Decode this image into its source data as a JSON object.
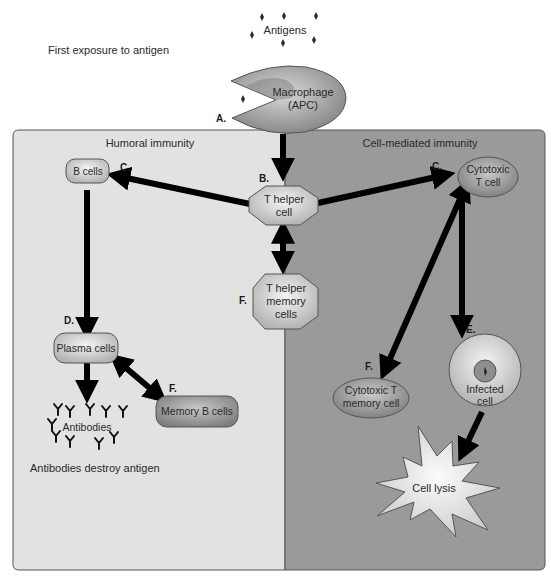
{
  "header": {
    "first_exposure": "First exposure to antigen",
    "antigens": "Antigens"
  },
  "macrophage": {
    "line1": "Macrophage",
    "line2": "(APC)",
    "step": "A."
  },
  "panels": {
    "left": {
      "title": "Humoral immunity",
      "color": "#e2e2e2"
    },
    "right": {
      "title": "Cell-mediated immunity",
      "color": "#9a9a9a"
    }
  },
  "nodes": {
    "t_helper": {
      "line1": "T helper",
      "line2": "cell",
      "step": "B."
    },
    "t_helper_memory": {
      "line1": "T helper",
      "line2": "memory",
      "line3": "cells",
      "step": "F."
    },
    "b_cells": {
      "label": "B cells",
      "step": "C."
    },
    "plasma_cells": {
      "label": "Plasma cells",
      "step": "D."
    },
    "memory_b_cells": {
      "label": "Memory B cells",
      "step": "F."
    },
    "antibodies": {
      "label": "Antibodies",
      "caption": "Antibodies destroy antigen"
    },
    "cytotoxic_t": {
      "line1": "Cytotoxic",
      "line2": "T cell",
      "step": "C."
    },
    "cytotoxic_t_memory": {
      "line1": "Cytotoxic T",
      "line2": "memory cell",
      "step": "F."
    },
    "infected_cell": {
      "line1": "Infected",
      "line2": "cell",
      "step": "E."
    },
    "cell_lysis": {
      "label": "Cell lysis"
    }
  }
}
